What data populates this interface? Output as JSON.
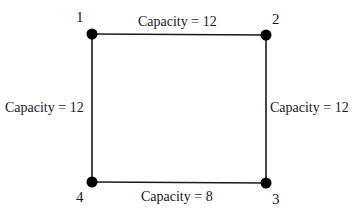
{
  "diagram": {
    "type": "network-graph",
    "nodes": [
      {
        "id": "1",
        "label": "1",
        "x": 92,
        "y": 34
      },
      {
        "id": "2",
        "label": "2",
        "x": 266,
        "y": 35
      },
      {
        "id": "3",
        "label": "3",
        "x": 266,
        "y": 183
      },
      {
        "id": "4",
        "label": "4",
        "x": 92,
        "y": 182
      }
    ],
    "edges": [
      {
        "from": "1",
        "to": "2",
        "label": "Capacity = 12",
        "capacity": 12
      },
      {
        "from": "2",
        "to": "3",
        "label": "Capacity = 12",
        "capacity": 12
      },
      {
        "from": "4",
        "to": "3",
        "label": "Capacity = 8",
        "capacity": 8
      },
      {
        "from": "1",
        "to": "4",
        "label": "Capacity = 12",
        "capacity": 12
      }
    ],
    "colors": {
      "line": "#1a1a1a",
      "node": "#000000",
      "background": "#ffffff"
    }
  }
}
